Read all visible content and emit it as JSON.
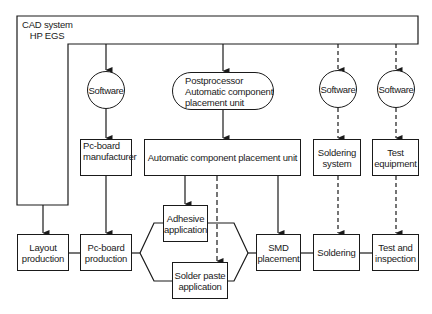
{
  "cad": {
    "line1": "CAD system",
    "line2": "HP EGS"
  },
  "software_nodes": [
    {
      "label": "Software"
    },
    {
      "label": "Software"
    },
    {
      "label": "Software"
    }
  ],
  "postprocessor": {
    "line1": "Postprocessor",
    "line2": "Automatic component",
    "line3": "placement unit"
  },
  "equipment": {
    "pcb_manufacturer": {
      "line1": "Pc-board",
      "line2": "manufacturer"
    },
    "auto_placement_unit": {
      "label": "Automatic component placement unit"
    },
    "soldering_system": {
      "line1": "Soldering",
      "line2": "system"
    },
    "test_equipment": {
      "line1": "Test",
      "line2": "equipment"
    }
  },
  "process": {
    "layout": {
      "line1": "Layout",
      "line2": "production"
    },
    "pcb_production": {
      "line1": "Pc-board",
      "line2": "production"
    },
    "adhesive": {
      "line1": "Adhesive",
      "line2": "application"
    },
    "solder_paste": {
      "line1": "Solder paste",
      "line2": "application"
    },
    "smd": {
      "line1": "SMD",
      "line2": "placement"
    },
    "soldering": {
      "label": "Soldering"
    },
    "test_inspection": {
      "line1": "Test and",
      "line2": "inspection"
    }
  },
  "colors": {
    "line": "#1a1a1a",
    "background": "#ffffff"
  }
}
